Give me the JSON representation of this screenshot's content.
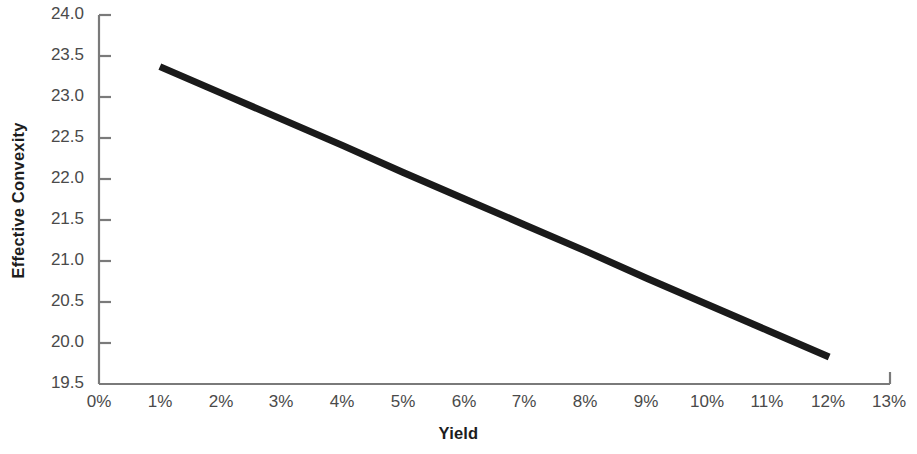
{
  "chart_data": {
    "type": "line",
    "title": "",
    "xlabel": "Yield",
    "ylabel": "Effective Convexity",
    "x": [
      1,
      12
    ],
    "values": [
      23.37,
      19.83
    ],
    "series": [
      {
        "name": "Effective Convexity",
        "x": [
          1,
          2,
          3,
          4,
          5,
          6,
          7,
          8,
          9,
          10,
          11,
          12
        ],
        "values": [
          23.37,
          23.05,
          22.73,
          22.41,
          22.08,
          21.76,
          21.44,
          21.12,
          20.79,
          20.47,
          20.15,
          19.83
        ]
      }
    ],
    "x_tick_labels": [
      "0%",
      "1%",
      "2%",
      "3%",
      "4%",
      "5%",
      "6%",
      "7%",
      "8%",
      "9%",
      "10%",
      "11%",
      "12%",
      "13%"
    ],
    "x_tick_values": [
      0,
      1,
      2,
      3,
      4,
      5,
      6,
      7,
      8,
      9,
      10,
      11,
      12,
      13
    ],
    "y_tick_labels": [
      "19.5",
      "20.0",
      "20.5",
      "21.0",
      "21.5",
      "22.0",
      "22.5",
      "23.0",
      "23.5",
      "24.0"
    ],
    "y_tick_values": [
      19.5,
      20.0,
      20.5,
      21.0,
      21.5,
      22.0,
      22.5,
      23.0,
      23.5,
      24.0
    ],
    "xlim": [
      0,
      13
    ],
    "ylim": [
      19.5,
      24.0
    ],
    "grid": false,
    "legend": false,
    "line_color": "#1a1a1a",
    "axis_color": "#7a7a7a",
    "tick_label_color": "#4a4a4a",
    "axis_title_color": "#1d1d1d",
    "background_color": "#ffffff"
  }
}
